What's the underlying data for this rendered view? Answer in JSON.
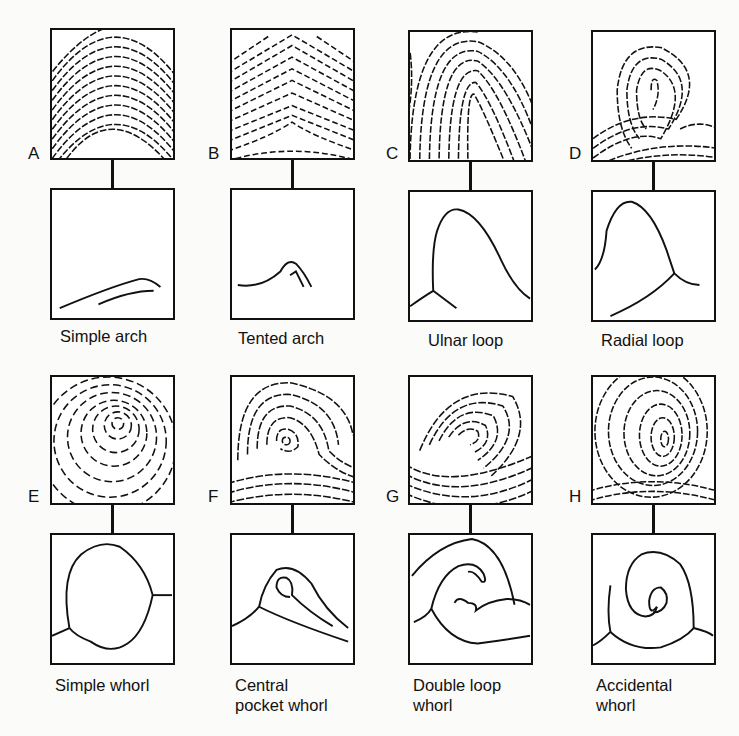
{
  "figure": {
    "panels": [
      {
        "letter": "A",
        "caption": "Simple arch",
        "caption_line2": ""
      },
      {
        "letter": "B",
        "caption": "Tented arch",
        "caption_line2": ""
      },
      {
        "letter": "C",
        "caption": "Ulnar loop",
        "caption_line2": ""
      },
      {
        "letter": "D",
        "caption": "Radial loop",
        "caption_line2": ""
      },
      {
        "letter": "E",
        "caption": "Simple whorl",
        "caption_line2": ""
      },
      {
        "letter": "F",
        "caption": "Central",
        "caption_line2": "pocket whorl"
      },
      {
        "letter": "G",
        "caption": "Double loop",
        "caption_line2": "whorl"
      },
      {
        "letter": "H",
        "caption": "Accidental",
        "caption_line2": "whorl"
      }
    ],
    "icons": {
      "fingerprint": "fingerprint-texture-icon",
      "schematic": "ridge-schematic-icon"
    },
    "colors": {
      "ink": "#111111",
      "paper": "#fbfbf9"
    }
  }
}
